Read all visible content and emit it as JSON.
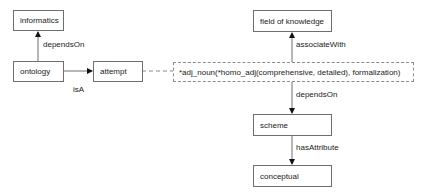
{
  "diagram": {
    "nodes": {
      "informatics": "informatics",
      "ontology": "ontology",
      "attempt": "attempt",
      "field_of_knowledge": "field of knowledge",
      "compound": "*adj_noun(*homo_adj(comprehensive, detailed), formalization)",
      "scheme": "scheme",
      "conceptual": "conceptual"
    },
    "edges": {
      "ontology_informatics": "dependsOn",
      "ontology_attempt": "isA",
      "compound_field": "associateWith",
      "compound_scheme": "dependsOn",
      "scheme_conceptual": "hasAttribute"
    },
    "colors": {
      "line": "#6e6e6e",
      "dashed": "#8a8a8a",
      "text": "#222222"
    }
  }
}
